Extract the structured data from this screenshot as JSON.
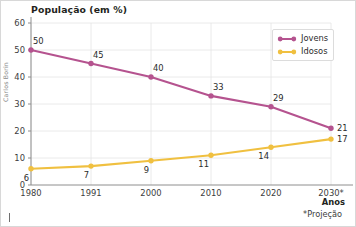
{
  "credit": "Carlos Borin",
  "legend": {
    "position": "top-right",
    "items": [
      {
        "label": "Jovens",
        "color": "#b5538f"
      },
      {
        "label": "Idosos",
        "color": "#f0c040"
      }
    ]
  },
  "axis": {
    "x_name": "Anos",
    "footnote": "*Projeção"
  },
  "chart_data": {
    "type": "line",
    "title": "População (em %)",
    "xlabel": "Anos",
    "ylabel": "",
    "categories": [
      "1980",
      "1991",
      "2000",
      "2010",
      "2020",
      "2030*"
    ],
    "x_tick_labels": [
      "1980",
      "1991",
      "2000",
      "2010",
      "2020",
      "2030*"
    ],
    "y_tick_labels": [
      "0",
      "10",
      "20",
      "30",
      "40",
      "50",
      "60"
    ],
    "y_ticks": [
      0,
      10,
      20,
      30,
      40,
      50,
      60
    ],
    "ylim": [
      0,
      60
    ],
    "grid": true,
    "legend_position": "top-right",
    "annotation": "*Projeção",
    "series": [
      {
        "name": "Jovens",
        "color": "#b5538f",
        "values": [
          50,
          45,
          40,
          33,
          29,
          21
        ],
        "labels": [
          "50",
          "45",
          "40",
          "33",
          "29",
          "21"
        ]
      },
      {
        "name": "Idosos",
        "color": "#f0c040",
        "values": [
          6,
          7,
          9,
          11,
          14,
          17
        ],
        "labels": [
          "6",
          "7",
          "9",
          "11",
          "14",
          "17"
        ]
      }
    ]
  }
}
